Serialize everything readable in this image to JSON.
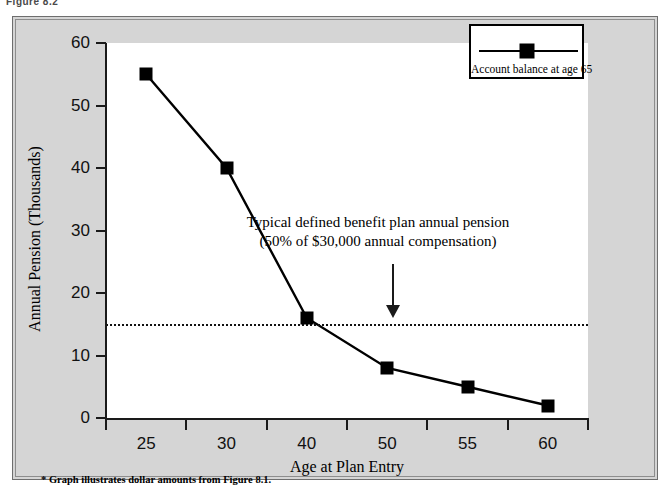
{
  "figure": {
    "caption": "Figure 8.2",
    "footnote": "* Graph illustrates dollar amounts from Figure 8.1."
  },
  "legend": {
    "label": "Account balance at age 65",
    "marker_icon": "filled-square-marker"
  },
  "annotation": {
    "line1": "Typical defined benefit plan annual pension",
    "line2": "(50% of $30,000 annual compensation)",
    "arrow_icon": "down-arrow-icon"
  },
  "colors": {
    "panel_background": "#d5d5d5",
    "plot_background": "#ffffff",
    "series": "#000000",
    "axis": "#1a1a1a",
    "threshold": "#111111"
  },
  "chart_data": {
    "type": "line",
    "title": "",
    "subtitle": "",
    "xlabel": "Age at Plan Entry",
    "ylabel": "Annual Pension (Thousands)",
    "categories": [
      "25",
      "30",
      "40",
      "50",
      "55",
      "60"
    ],
    "series": [
      {
        "name": "Account balance at age 65",
        "values": [
          55,
          40,
          16,
          8,
          5,
          2
        ],
        "marker": "square",
        "color": "#000000"
      }
    ],
    "ylim": [
      0,
      60
    ],
    "yticks": [
      0,
      10,
      20,
      30,
      40,
      50,
      60
    ],
    "ytick_labels": [
      "0",
      "10",
      "20",
      "30",
      "40",
      "50",
      "60"
    ],
    "xtick_labels": [
      "25",
      "30",
      "40",
      "50",
      "55",
      "60"
    ],
    "grid": false,
    "legend_position": "top-right",
    "annotations": [
      {
        "type": "threshold-line",
        "style": "dotted",
        "value": 15,
        "label": "Typical defined benefit plan annual pension (50% of $30,000 annual compensation)"
      }
    ]
  }
}
